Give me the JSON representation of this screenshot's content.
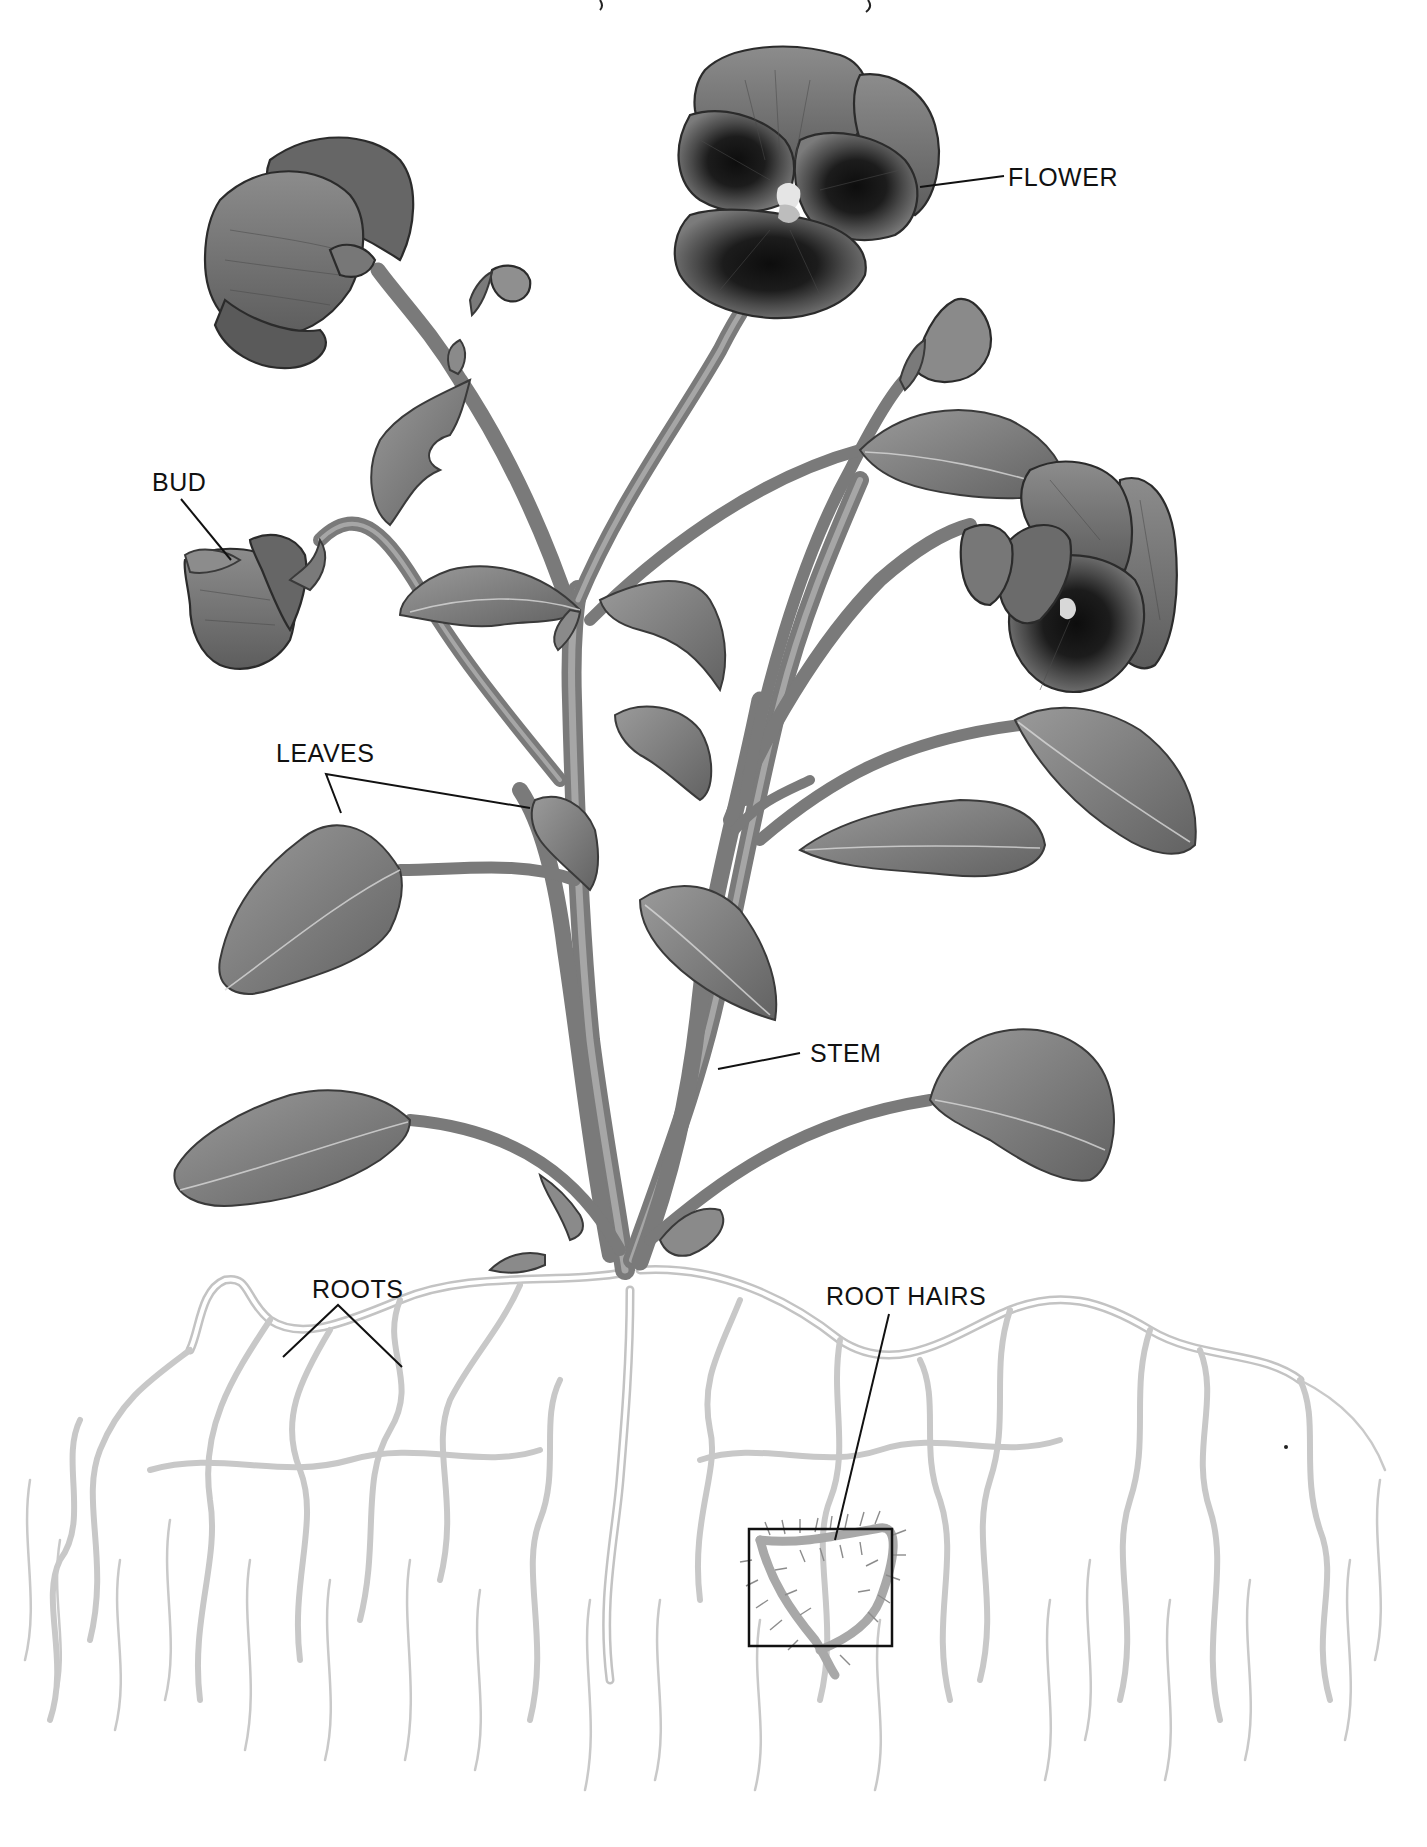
{
  "diagram": {
    "labels": {
      "flower": "FLOWER",
      "bud": "BUD",
      "leaves": "LEAVES",
      "stem": "STEM",
      "roots": "ROOTS",
      "root_hairs": "ROOT HAIRS"
    },
    "colors": {
      "background": "#ffffff",
      "label_text": "#111111",
      "leader_line": "#111111",
      "petal_dark": "#1e1e1e",
      "petal_mid": "#6e6e6e",
      "leaf": "#7d7d7d",
      "stem": "#8a8a8a",
      "root": "#c3c3c3"
    },
    "inset": {
      "name": "root hairs magnification box"
    }
  }
}
